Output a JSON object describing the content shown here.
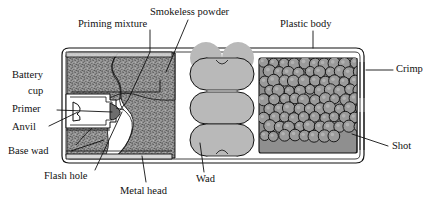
{
  "figure": {
    "background_color": "#ffffff",
    "ink_color": "#111111"
  },
  "labels": {
    "priming_mixture": "Priming mixture",
    "smokeless_powder": "Smokeless powder",
    "plastic_body": "Plastic body",
    "crimp": "Crimp",
    "shot": "Shot",
    "battery_cup_line1": "Battery",
    "battery_cup_line2": "cup",
    "primer": "Primer",
    "anvil": "Anvil",
    "base_wad": "Base wad",
    "flash_hole": "Flash hole",
    "metal_head": "Metal head",
    "wad": "Wad"
  },
  "parts": {
    "powder_fill_color": "#8f8f8f",
    "wad_fill_color": "#b9b9b9",
    "shot_fill_color": "#9a9a9a",
    "case_fill_color": "#ffffff",
    "metal_head_color": "#d8d8d8",
    "wad_segment_count": 3,
    "shot_pellet_count": 96
  }
}
